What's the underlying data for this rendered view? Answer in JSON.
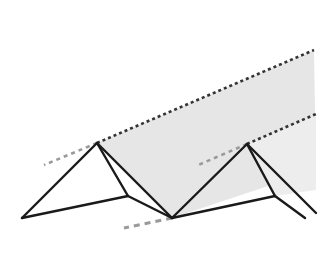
{
  "figure": {
    "title": "Pleated zigzag surface diagram",
    "type": "line-diagram",
    "background_color": "#ffffff",
    "canvas": {
      "width": 325,
      "height": 271
    },
    "styles": {
      "fill_color": "#e6e6e6",
      "fill_color_light": "#ededed",
      "solid_stroke_color": "#1a1a1a",
      "dashed_stroke_color": "#8c8c8c",
      "solid_stroke_width": 2.4,
      "dashed_stroke_width": 2.6,
      "ridge_dash_pattern": "3 3",
      "extension_dash_pattern": "5 5"
    },
    "vertices": {
      "left_tip": {
        "x": 22,
        "y": 218,
        "label": "left valley tip"
      },
      "peak_left": {
        "x": 97,
        "y": 143,
        "label": "left ridge peak"
      },
      "valley_mid": {
        "x": 172,
        "y": 218,
        "label": "middle valley"
      },
      "peak_right": {
        "x": 247,
        "y": 144,
        "label": "right ridge peak"
      },
      "right_tip": {
        "x": 305,
        "y": 218,
        "label": "right valley tip"
      },
      "ridge_top_right": {
        "x": 314,
        "y": 50,
        "label": "upper ridge far end"
      },
      "ridge_top_left": {
        "x": 97,
        "y": 143,
        "label": "upper ridge near end"
      },
      "lower_ridge_right": {
        "x": 316,
        "y": 115,
        "label": "lower ridge far end"
      },
      "back_edge_right": {
        "x": 316,
        "y": 170,
        "label": "right back edge"
      },
      "front_fold_right": {
        "x": 275,
        "y": 196,
        "label": "right front fold"
      },
      "front_fold_left": {
        "x": 128,
        "y": 196,
        "label": "left front fold"
      }
    },
    "shaded_facets": [
      {
        "name": "upper-facet",
        "points": "97,143 314,50 316,170 172,218",
        "fill": "#e6e6e6"
      },
      {
        "name": "lower-right-facet",
        "points": "247,144 316,115 316,190 275,196",
        "fill": "#ededed"
      }
    ],
    "solid_lines": [
      {
        "name": "edge-left-tip-to-peak-left",
        "x1": 22,
        "y1": 218,
        "x2": 97,
        "y2": 143
      },
      {
        "name": "edge-left-tip-to-front-fold",
        "x1": 22,
        "y1": 218,
        "x2": 128,
        "y2": 196
      },
      {
        "name": "edge-peak-left-to-front-fold",
        "x1": 97,
        "y1": 143,
        "x2": 128,
        "y2": 196
      },
      {
        "name": "edge-front-fold-to-valley-mid",
        "x1": 128,
        "y1": 196,
        "x2": 172,
        "y2": 218
      },
      {
        "name": "edge-peak-left-to-valley-mid",
        "x1": 97,
        "y1": 143,
        "x2": 172,
        "y2": 218
      },
      {
        "name": "edge-valley-mid-to-peak-right",
        "x1": 172,
        "y1": 218,
        "x2": 247,
        "y2": 144
      },
      {
        "name": "edge-valley-mid-to-front-fold-right",
        "x1": 172,
        "y1": 218,
        "x2": 275,
        "y2": 196
      },
      {
        "name": "edge-peak-right-to-front-fold-right",
        "x1": 247,
        "y1": 144,
        "x2": 275,
        "y2": 196
      },
      {
        "name": "edge-front-fold-right-to-right-tip",
        "x1": 275,
        "y1": 196,
        "x2": 305,
        "y2": 218
      },
      {
        "name": "edge-peak-right-to-right-tip",
        "x1": 247,
        "y1": 144,
        "x2": 316,
        "y2": 213
      }
    ],
    "dashed_lines": [
      {
        "name": "upper-ridge-crease",
        "x1": 97,
        "y1": 143,
        "x2": 314,
        "y2": 50,
        "color": "#333333",
        "dash": "3 3",
        "width": 2.6
      },
      {
        "name": "upper-ridge-extension-left",
        "x1": 97,
        "y1": 143,
        "x2": 44,
        "y2": 165,
        "color": "#9a9a9a",
        "dash": "4 4",
        "width": 2.6
      },
      {
        "name": "lower-ridge-crease",
        "x1": 247,
        "y1": 144,
        "x2": 316,
        "y2": 114,
        "color": "#333333",
        "dash": "3 3",
        "width": 2.6
      },
      {
        "name": "lower-ridge-extension-left",
        "x1": 247,
        "y1": 144,
        "x2": 196,
        "y2": 166,
        "color": "#9a9a9a",
        "dash": "4 4",
        "width": 2.6
      },
      {
        "name": "valley-crease-extension-bottom",
        "x1": 172,
        "y1": 218,
        "x2": 124,
        "y2": 228,
        "color": "#9a9a9a",
        "dash": "6 5",
        "width": 3.0
      }
    ]
  }
}
